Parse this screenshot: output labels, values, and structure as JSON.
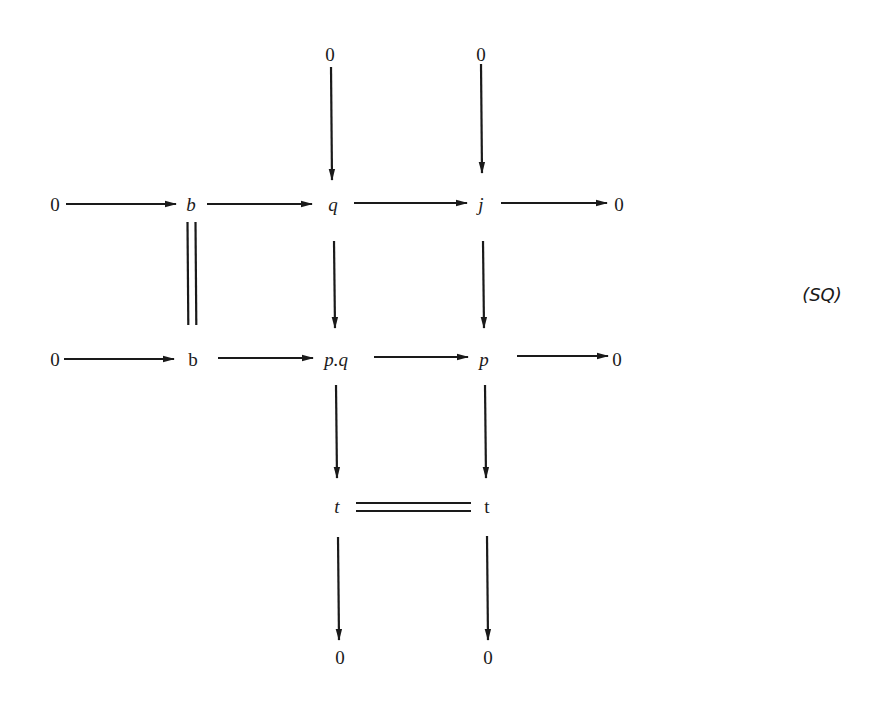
{
  "diagram": {
    "tag": "(SQ)",
    "nodes": {
      "zero_top_q": {
        "label": "0",
        "x": 330,
        "y": 55,
        "italic": false
      },
      "zero_top_j": {
        "label": "0",
        "x": 481,
        "y": 55,
        "italic": false
      },
      "zero_r1_left": {
        "label": "0",
        "x": 55,
        "y": 205,
        "italic": false
      },
      "b_r1": {
        "label": "b",
        "x": 191,
        "y": 205,
        "italic": true
      },
      "q": {
        "label": "q",
        "x": 333,
        "y": 205,
        "italic": true
      },
      "j": {
        "label": "j",
        "x": 481,
        "y": 205,
        "italic": true
      },
      "zero_r1_right": {
        "label": "0",
        "x": 619,
        "y": 205,
        "italic": false
      },
      "zero_r2_left": {
        "label": "0",
        "x": 55,
        "y": 360,
        "italic": false
      },
      "b_r2": {
        "label": "b",
        "x": 193,
        "y": 360,
        "italic": false
      },
      "pq": {
        "label": "p.q",
        "x": 336,
        "y": 360,
        "italic": true
      },
      "p": {
        "label": "p",
        "x": 484,
        "y": 360,
        "italic": true
      },
      "zero_r2_right": {
        "label": "0",
        "x": 617,
        "y": 360,
        "italic": false
      },
      "t_left": {
        "label": "t",
        "x": 337,
        "y": 507,
        "italic": true
      },
      "t_right": {
        "label": "t",
        "x": 487,
        "y": 507,
        "italic": false
      },
      "zero_bottom_left": {
        "label": "0",
        "x": 340,
        "y": 658,
        "italic": false
      },
      "zero_bottom_right": {
        "label": "0",
        "x": 488,
        "y": 658,
        "italic": false
      }
    },
    "arrows": [
      {
        "from": "zero_r1_left",
        "to": "b_r1",
        "x1": 66,
        "y1": 204,
        "x2": 176,
        "y2": 204,
        "type": "mono"
      },
      {
        "from": "b_r1",
        "to": "q",
        "x1": 207,
        "y1": 204,
        "x2": 312,
        "y2": 204,
        "type": "mono"
      },
      {
        "from": "q",
        "to": "j",
        "x1": 354,
        "y1": 203,
        "x2": 467,
        "y2": 203,
        "type": "epi"
      },
      {
        "from": "j",
        "to": "zero_r1_right",
        "x1": 501,
        "y1": 203,
        "x2": 607,
        "y2": 203,
        "type": "epi"
      },
      {
        "from": "zero_top_q",
        "to": "q",
        "x1": 331,
        "y1": 67,
        "x2": 332,
        "y2": 180,
        "type": "mono"
      },
      {
        "from": "zero_top_j",
        "to": "j",
        "x1": 481,
        "y1": 64,
        "x2": 482,
        "y2": 173,
        "type": "mono"
      },
      {
        "from": "q",
        "to": "pq",
        "x1": 334,
        "y1": 241,
        "x2": 335,
        "y2": 328,
        "type": "mono"
      },
      {
        "from": "j",
        "to": "p",
        "x1": 483,
        "y1": 241,
        "x2": 484,
        "y2": 328,
        "type": "mono"
      },
      {
        "from": "zero_r2_left",
        "to": "b_r2",
        "x1": 64,
        "y1": 359,
        "x2": 174,
        "y2": 359,
        "type": "mono"
      },
      {
        "from": "b_r2",
        "to": "pq",
        "x1": 218,
        "y1": 358,
        "x2": 313,
        "y2": 358,
        "type": "mono"
      },
      {
        "from": "pq",
        "to": "p",
        "x1": 374,
        "y1": 357,
        "x2": 468,
        "y2": 357,
        "type": "epi"
      },
      {
        "from": "p",
        "to": "zero_r2_right",
        "x1": 517,
        "y1": 356,
        "x2": 608,
        "y2": 356,
        "type": "epi"
      },
      {
        "from": "pq",
        "to": "t_left",
        "x1": 336,
        "y1": 385,
        "x2": 337,
        "y2": 478,
        "type": "epi"
      },
      {
        "from": "p",
        "to": "t_right",
        "x1": 485,
        "y1": 385,
        "x2": 486,
        "y2": 478,
        "type": "epi"
      },
      {
        "from": "t_left",
        "to": "zero_bottom_left",
        "x1": 338,
        "y1": 537,
        "x2": 339,
        "y2": 640,
        "type": "epi"
      },
      {
        "from": "t_right",
        "to": "zero_bottom_right",
        "x1": 487,
        "y1": 536,
        "x2": 488,
        "y2": 640,
        "type": "epi"
      }
    ],
    "equalities": [
      {
        "from": "b_r1",
        "to": "b_r2",
        "orientation": "vertical",
        "x": 191.5,
        "y1": 222,
        "y2": 325,
        "gap": 8
      },
      {
        "from": "t_left",
        "to": "t_right",
        "orientation": "horizontal",
        "y": 507,
        "x1": 356,
        "x2": 471,
        "gap": 8
      }
    ],
    "tag_position": {
      "x": 822,
      "y": 295
    }
  }
}
